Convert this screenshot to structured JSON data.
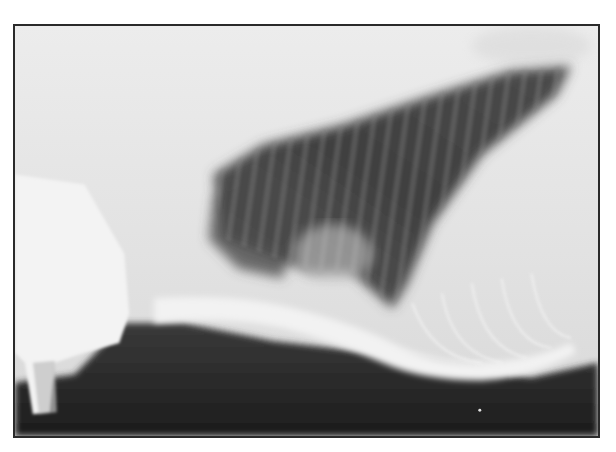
{
  "figure": {
    "type": "radiograph",
    "view": "lateral thoracic",
    "alt": "Lateral thoracic radiograph",
    "colors": {
      "frame_border": "#2a2a2a",
      "soft_tissue": "#e6e6e6",
      "lung_dark": "#3c3c3c",
      "background_dark": "#1e1e1e"
    }
  }
}
